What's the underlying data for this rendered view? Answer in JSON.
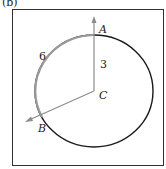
{
  "figure": {
    "part_label": "(b)",
    "points": {
      "A": "A",
      "B": "B",
      "C": "C"
    },
    "arc_length_label": "6",
    "radius_label": "3",
    "colors": {
      "arc_highlight": "#9a9a9a",
      "circle": "#1a1a1a",
      "vectors": "#8c8c8c",
      "frame": "#333333"
    }
  }
}
